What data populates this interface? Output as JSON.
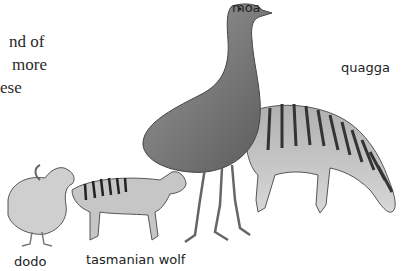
{
  "text_fragment": {
    "lines": [
      "nd of",
      "more",
      "ese"
    ]
  },
  "labels": {
    "moa": "moa",
    "quagga": "quagga",
    "dodo": "dodo",
    "tasmanian_wolf": "tasmanian wolf"
  }
}
